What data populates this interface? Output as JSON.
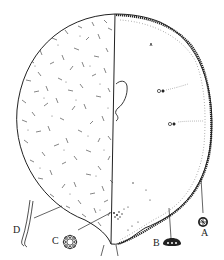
{
  "figure": {
    "type": "scientific line drawing",
    "colors": {
      "ink": "#222222",
      "background": "#ffffff"
    }
  },
  "labels": [
    {
      "id": "A",
      "text": "A",
      "x": 201,
      "y": 232,
      "detail": "rosette-shaped granule with radial spokes"
    },
    {
      "id": "B",
      "text": "B",
      "x": 153,
      "y": 238,
      "detail": "dark dome-shaped structure with three pale dots"
    },
    {
      "id": "C",
      "text": "C",
      "x": 52,
      "y": 233,
      "detail": "ring of small circles"
    },
    {
      "id": "D",
      "text": "D",
      "x": 13,
      "y": 226,
      "detail": "pair of elongated rod-shaped bodies"
    }
  ]
}
